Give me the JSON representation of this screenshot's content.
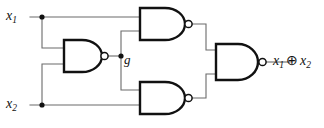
{
  "figure": {
    "name": "nand-xor-circuit",
    "background_color": "#ffffff",
    "wire_color": "#6b6b6b",
    "gate_outline_color": "#111111"
  },
  "labels": {
    "input_1": {
      "base": "x",
      "sub": "1"
    },
    "input_2": {
      "base": "x",
      "sub": "2"
    },
    "intermediate": "g",
    "output": {
      "left_base": "x",
      "left_sub": "1",
      "operator": "⊕",
      "right_base": "x",
      "right_sub": "2"
    }
  },
  "gates": [
    {
      "id": "nand-top",
      "type": "NAND",
      "inputs": [
        "x1",
        "g"
      ],
      "output": "nand-top-out"
    },
    {
      "id": "nand-left",
      "type": "NAND",
      "inputs": [
        "x1",
        "x2"
      ],
      "output": "g"
    },
    {
      "id": "nand-bottom",
      "type": "NAND",
      "inputs": [
        "g",
        "x2"
      ],
      "output": "nand-bottom-out"
    },
    {
      "id": "nand-output",
      "type": "NAND",
      "inputs": [
        "nand-top-out",
        "nand-bottom-out"
      ],
      "output": "x1 ⊕ x2"
    }
  ],
  "junctions": [
    {
      "id": "x1-tap",
      "signal": "x1"
    },
    {
      "id": "x2-tap",
      "signal": "x2"
    },
    {
      "id": "g-tap",
      "signal": "g"
    }
  ]
}
